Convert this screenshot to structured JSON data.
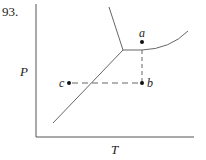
{
  "problem_number": "93.",
  "axes": {
    "x_label": "T",
    "y_label": "P"
  },
  "points": [
    {
      "id": "a",
      "label": "a"
    },
    {
      "id": "b",
      "label": "b"
    },
    {
      "id": "c",
      "label": "c"
    }
  ],
  "colors": {
    "line": "#555555",
    "point": "#111111",
    "text": "#222222"
  }
}
